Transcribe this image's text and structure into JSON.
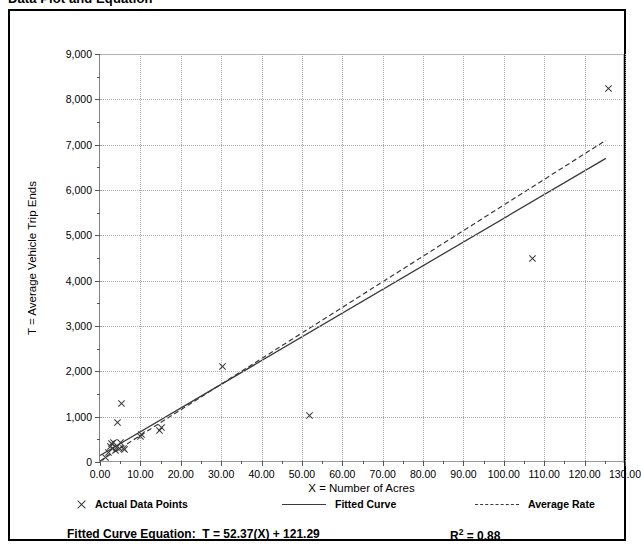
{
  "title": "Data Plot and Equation",
  "axes": {
    "x_title": "X = Number of Acres",
    "y_title": "T = Average Vehicle Trip Ends"
  },
  "legend": {
    "points_label": "Actual Data Points",
    "fitted_label": "Fitted Curve",
    "average_label": "Average Rate"
  },
  "equation": {
    "prefix": "Fitted Curve Equation:",
    "formula": "T = 52.37(X) + 121.29",
    "r2_label": "R",
    "r2_exp": "2",
    "r2_value": "= 0.88"
  },
  "chart_data": {
    "type": "scatter",
    "title": "Data Plot and Equation",
    "xlabel": "X = Number of Acres",
    "ylabel": "T = Average Vehicle Trip Ends",
    "xlim": [
      0,
      130
    ],
    "ylim": [
      0,
      9000
    ],
    "xticks": [
      0,
      10,
      20,
      30,
      40,
      50,
      60,
      70,
      80,
      90,
      100,
      110,
      120,
      130
    ],
    "xticklabels": [
      "0.00",
      "10.00",
      "20.00",
      "30.00",
      "40.00",
      "50.00",
      "60.00",
      "70.00",
      "80.00",
      "90.00",
      "100.00",
      "110.00",
      "120.00",
      "130.00"
    ],
    "yticks": [
      0,
      1000,
      2000,
      3000,
      4000,
      5000,
      6000,
      7000,
      8000,
      9000
    ],
    "yticklabels": [
      "0",
      "1,000",
      "2,000",
      "3,000",
      "4,000",
      "5,000",
      "6,000",
      "7,000",
      "8,000",
      "9,000"
    ],
    "grid": true,
    "legend_position": "below-axes",
    "series": [
      {
        "name": "Actual Data Points",
        "type": "scatter",
        "marker": "x",
        "points": [
          [
            1.2,
            90
          ],
          [
            2.0,
            210
          ],
          [
            2.4,
            350
          ],
          [
            2.6,
            400
          ],
          [
            3.0,
            300
          ],
          [
            3.2,
            420
          ],
          [
            3.6,
            250
          ],
          [
            4.0,
            330
          ],
          [
            4.2,
            880
          ],
          [
            4.6,
            300
          ],
          [
            5.0,
            440
          ],
          [
            5.2,
            1280
          ],
          [
            5.6,
            290
          ],
          [
            6.0,
            270
          ],
          [
            9.8,
            560
          ],
          [
            10.2,
            600
          ],
          [
            14.6,
            700
          ],
          [
            15.0,
            760
          ],
          [
            30.2,
            2100
          ],
          [
            51.8,
            1020
          ],
          [
            107.0,
            4490
          ],
          [
            125.8,
            8240
          ]
        ]
      },
      {
        "name": "Fitted Curve",
        "type": "line",
        "style": "solid",
        "equation": "T = 52.37(X) + 121.29",
        "slope": 52.37,
        "intercept": 121.29,
        "r2": 0.88,
        "x_range": [
          0,
          125.5
        ],
        "endpoints": [
          [
            0,
            121
          ],
          [
            125.5,
            6693
          ]
        ]
      },
      {
        "name": "Average Rate",
        "type": "line",
        "style": "dashed",
        "slope": 56.5,
        "intercept": 0,
        "x_range": [
          0,
          125.5
        ],
        "endpoints": [
          [
            0,
            0
          ],
          [
            125.5,
            7091
          ]
        ]
      }
    ]
  }
}
